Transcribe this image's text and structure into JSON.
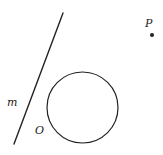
{
  "diagram": {
    "line": {
      "label": "m",
      "x1": 63,
      "y1": 13,
      "x2": 14,
      "y2": 144,
      "color": "#222222"
    },
    "circle": {
      "label": "O",
      "cx": 82.5,
      "cy": 107.5,
      "r": 35.5,
      "color": "#222222"
    },
    "point": {
      "label": "P",
      "cx": 152,
      "cy": 35,
      "r": 2,
      "color": "#222222"
    },
    "labels": {
      "m": {
        "text": "m",
        "x": 7,
        "y": 106
      },
      "O": {
        "text": "O",
        "x": 35,
        "y": 134
      },
      "P": {
        "text": "P",
        "x": 145,
        "y": 27
      }
    }
  }
}
